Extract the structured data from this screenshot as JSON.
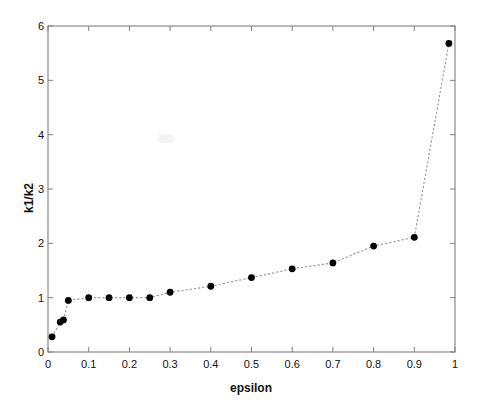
{
  "chart_data": {
    "type": "scatter",
    "title": "",
    "xlabel": "epsilon",
    "ylabel": "k1/k2",
    "xlim": [
      0,
      1
    ],
    "ylim": [
      0,
      6
    ],
    "xticks": [
      "0",
      "0.1",
      "0.2",
      "0.3",
      "0.4",
      "0.5",
      "0.6",
      "0.7",
      "0.8",
      "0.9",
      "1"
    ],
    "xtick_values": [
      0,
      0.1,
      0.2,
      0.3,
      0.4,
      0.5,
      0.6,
      0.7,
      0.8,
      0.9,
      1
    ],
    "yticks": [
      "0",
      "1",
      "2",
      "3",
      "4",
      "5",
      "6"
    ],
    "ytick_values": [
      0,
      1,
      2,
      3,
      4,
      5,
      6
    ],
    "grid": false,
    "legend": null,
    "series": [
      {
        "name": "k1/k2 vs epsilon",
        "marker": "filled-circle",
        "marker_color": "#000000",
        "line_style": "dotted",
        "line_color": "#999999",
        "x": [
          0.01,
          0.03,
          0.038,
          0.05,
          0.1,
          0.15,
          0.2,
          0.25,
          0.3,
          0.4,
          0.5,
          0.6,
          0.7,
          0.8,
          0.9,
          0.985
        ],
        "y": [
          0.28,
          0.55,
          0.59,
          0.95,
          1.0,
          1.0,
          1.0,
          1.0,
          1.1,
          1.21,
          1.37,
          1.53,
          1.64,
          1.95,
          2.11,
          5.68
        ]
      }
    ]
  },
  "figure": {
    "background_color": "#ffffff",
    "axes_color": "#808080"
  }
}
